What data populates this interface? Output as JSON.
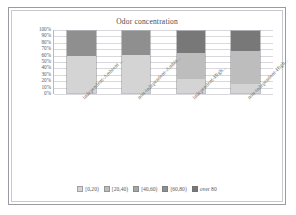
{
  "chart_data": {
    "type": "bar",
    "subtype": "stacked-100-percent",
    "title": "Odor concentration",
    "xlabel": "",
    "ylabel": "",
    "ylim": [
      0,
      100
    ],
    "ytick_labels": [
      "100%",
      "90%",
      "80%",
      "70%",
      "60%",
      "50%",
      "40%",
      "30%",
      "20%",
      "10%",
      "0%"
    ],
    "ytick_values": [
      100,
      90,
      80,
      70,
      60,
      50,
      40,
      30,
      20,
      10,
      0
    ],
    "grid": true,
    "legend_position": "bottom",
    "categories": [
      "independent-Ambient ...",
      "non-independent-Ambie...",
      "independent-High...",
      "non-independent-High..."
    ],
    "series": [
      {
        "name": "[0,20)",
        "color": "#d4d4d4",
        "values": [
          60,
          62,
          22,
          15
        ]
      },
      {
        "name": "[20,40)",
        "color": "#bdbdbd",
        "values": [
          0,
          0,
          43,
          53
        ]
      },
      {
        "name": "[40,60)",
        "color": "#a6a6a6",
        "values": [
          0,
          0,
          0,
          0
        ]
      },
      {
        "name": "[60,80)",
        "color": "#8f8f8f",
        "values": [
          40,
          38,
          0,
          0
        ]
      },
      {
        "name": "over 80",
        "color": "#787878",
        "values": [
          0,
          0,
          35,
          32
        ]
      }
    ]
  },
  "legend": {
    "items": [
      {
        "label": "[0,20)"
      },
      {
        "label": "[20,40)"
      },
      {
        "label": "[40,60)"
      },
      {
        "label": "[60,80)"
      },
      {
        "label": "over 80"
      }
    ]
  }
}
